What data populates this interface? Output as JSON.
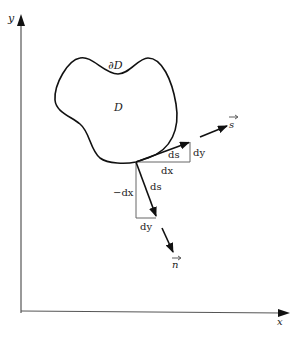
{
  "diagram": {
    "axes": {
      "x_label": "x",
      "y_label": "y"
    },
    "region": {
      "label": "D",
      "boundary_label": "∂D"
    },
    "tangent": {
      "vector_label": "s",
      "hyp_label": "ds",
      "horiz_label": "dx",
      "vert_label": "dy"
    },
    "normal": {
      "vector_label": "n",
      "hyp_label": "ds",
      "vert_label": "−dx",
      "horiz_label": "dy"
    }
  }
}
